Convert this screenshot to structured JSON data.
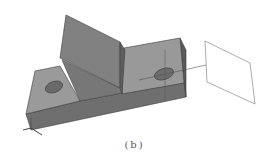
{
  "figure": {
    "caption": "(b)",
    "colors": {
      "background": "#ffffff",
      "top_face_light": "#9a9a9a",
      "front_face": "#6f6f6f",
      "wedge_face": "#808080",
      "wedge_side": "#5e5e5e",
      "right_side": "#666666",
      "hole": "#6a6a6a",
      "edge": "#3a3a3a",
      "plane_outline": "#8a8a8a",
      "axis_line": "#555555"
    }
  }
}
